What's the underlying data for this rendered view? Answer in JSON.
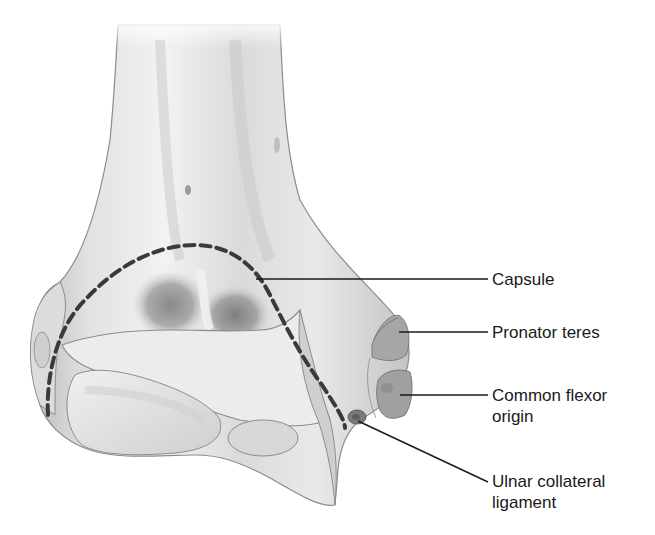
{
  "figure": {
    "labels": [
      {
        "id": "capsule",
        "lines": [
          "Capsule"
        ]
      },
      {
        "id": "pronator-teres",
        "lines": [
          "Pronator teres"
        ]
      },
      {
        "id": "common-flexor-origin",
        "lines": [
          "Common flexor",
          "origin"
        ]
      },
      {
        "id": "ulnar-collateral-ligament",
        "lines": [
          "Ulnar collateral",
          "ligament"
        ]
      }
    ]
  },
  "colors": {
    "bone_light": "#e6e6e6",
    "bone_mid": "#c9c9c9",
    "bone_shadow": "#8a8a8a",
    "outline": "#8c8c8c",
    "capsule_dash": "#3a3a3a",
    "muscle_origin": "#9a9a9a",
    "leader_line": "#1a1a1a",
    "text": "#1a1a1a"
  }
}
